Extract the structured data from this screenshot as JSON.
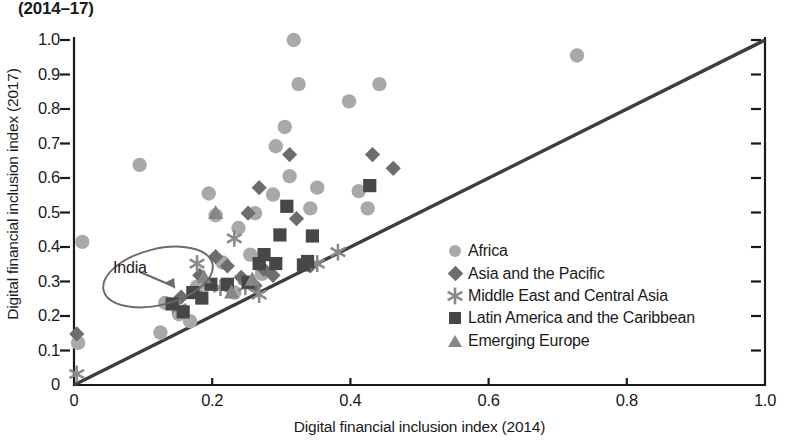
{
  "title": "(2014–17)",
  "axes": {
    "xlabel": "Digital financial inclusion index (2014)",
    "ylabel": "Digital financial inclusion index (2017)",
    "xticks": [
      "0",
      "0.2",
      "0.4",
      "0.6",
      "0.8",
      "1.0"
    ],
    "yticks": [
      "0",
      "0.1",
      "0.2",
      "0.3",
      "0.4",
      "0.5",
      "0.6",
      "0.7",
      "0.8",
      "0.9",
      "1.0"
    ]
  },
  "annotation": {
    "label": "India",
    "target_x": 0.155,
    "target_y": 0.255
  },
  "colors": {
    "africa": "#a9a9a9",
    "asia_pacific": "#6d6d6d",
    "middle_east": "#8a8a8a",
    "latin_america": "#474747",
    "emerging_europe": "#878787",
    "line": "#3d3d3d",
    "axis": "#1a1a1a",
    "annotation": "#6a6a6a"
  },
  "legend": {
    "items": [
      {
        "label": "Africa",
        "symbol": "circle-icon",
        "color": "#a9a9a9"
      },
      {
        "label": "Asia and the Pacific",
        "symbol": "diamond-icon",
        "color": "#6d6d6d"
      },
      {
        "label": "Middle East and Central Asia",
        "symbol": "asterisk-icon",
        "color": "#8a8a8a"
      },
      {
        "label": "Latin America and the Caribbean",
        "symbol": "square-icon",
        "color": "#474747"
      },
      {
        "label": "Emerging Europe",
        "symbol": "triangle-icon",
        "color": "#878787"
      }
    ]
  },
  "chart_data": {
    "type": "scatter",
    "title": "(2014–17)",
    "xlabel": "Digital financial inclusion index (2014)",
    "ylabel": "Digital financial inclusion index (2017)",
    "xlim": [
      0,
      1.0
    ],
    "ylim": [
      0,
      1.0
    ],
    "grid": false,
    "legend_position": "inside-right",
    "reference_line": {
      "type": "45-degree",
      "from": [
        0,
        0
      ],
      "to": [
        1.0,
        1.0
      ]
    },
    "annotations": [
      {
        "text": "India",
        "points_to": [
          0.155,
          0.255
        ],
        "shape": "ellipse-with-arrow"
      }
    ],
    "series": [
      {
        "name": "Africa",
        "marker": "circle",
        "color": "#a9a9a9",
        "points": [
          [
            0.012,
            0.415
          ],
          [
            0.006,
            0.122
          ],
          [
            0.095,
            0.638
          ],
          [
            0.125,
            0.152
          ],
          [
            0.132,
            0.238
          ],
          [
            0.152,
            0.205
          ],
          [
            0.168,
            0.185
          ],
          [
            0.178,
            0.285
          ],
          [
            0.195,
            0.555
          ],
          [
            0.205,
            0.492
          ],
          [
            0.215,
            0.355
          ],
          [
            0.232,
            0.268
          ],
          [
            0.238,
            0.455
          ],
          [
            0.255,
            0.378
          ],
          [
            0.262,
            0.498
          ],
          [
            0.272,
            0.322
          ],
          [
            0.288,
            0.552
          ],
          [
            0.292,
            0.692
          ],
          [
            0.305,
            0.748
          ],
          [
            0.312,
            0.605
          ],
          [
            0.318,
            1.0
          ],
          [
            0.325,
            0.872
          ],
          [
            0.342,
            0.512
          ],
          [
            0.352,
            0.572
          ],
          [
            0.398,
            0.822
          ],
          [
            0.412,
            0.562
          ],
          [
            0.425,
            0.512
          ],
          [
            0.442,
            0.872
          ],
          [
            0.728,
            0.955
          ]
        ]
      },
      {
        "name": "Asia and the Pacific",
        "marker": "diamond",
        "color": "#6d6d6d",
        "points": [
          [
            0.004,
            0.148
          ],
          [
            0.155,
            0.255
          ],
          [
            0.182,
            0.318
          ],
          [
            0.205,
            0.372
          ],
          [
            0.222,
            0.345
          ],
          [
            0.242,
            0.312
          ],
          [
            0.252,
            0.498
          ],
          [
            0.262,
            0.288
          ],
          [
            0.268,
            0.572
          ],
          [
            0.275,
            0.335
          ],
          [
            0.288,
            0.318
          ],
          [
            0.312,
            0.668
          ],
          [
            0.322,
            0.482
          ],
          [
            0.342,
            0.345
          ],
          [
            0.432,
            0.668
          ],
          [
            0.462,
            0.628
          ]
        ]
      },
      {
        "name": "Middle East and Central Asia",
        "marker": "asterisk",
        "color": "#8a8a8a",
        "points": [
          [
            0.004,
            0.032
          ],
          [
            0.152,
            0.222
          ],
          [
            0.178,
            0.352
          ],
          [
            0.212,
            0.282
          ],
          [
            0.232,
            0.425
          ],
          [
            0.248,
            0.285
          ],
          [
            0.268,
            0.262
          ],
          [
            0.352,
            0.352
          ],
          [
            0.382,
            0.385
          ]
        ]
      },
      {
        "name": "Latin America and the Caribbean",
        "marker": "square",
        "color": "#474747",
        "points": [
          [
            0.142,
            0.235
          ],
          [
            0.158,
            0.212
          ],
          [
            0.172,
            0.268
          ],
          [
            0.185,
            0.252
          ],
          [
            0.198,
            0.292
          ],
          [
            0.222,
            0.292
          ],
          [
            0.252,
            0.298
          ],
          [
            0.268,
            0.352
          ],
          [
            0.275,
            0.378
          ],
          [
            0.292,
            0.352
          ],
          [
            0.298,
            0.435
          ],
          [
            0.308,
            0.518
          ],
          [
            0.332,
            0.348
          ],
          [
            0.338,
            0.358
          ],
          [
            0.345,
            0.432
          ],
          [
            0.428,
            0.578
          ]
        ]
      },
      {
        "name": "Emerging Europe",
        "marker": "triangle",
        "color": "#878787",
        "points": [
          [
            0.188,
            0.312
          ],
          [
            0.205,
            0.498
          ],
          [
            0.228,
            0.268
          ],
          [
            0.258,
            0.305
          ]
        ]
      }
    ]
  }
}
